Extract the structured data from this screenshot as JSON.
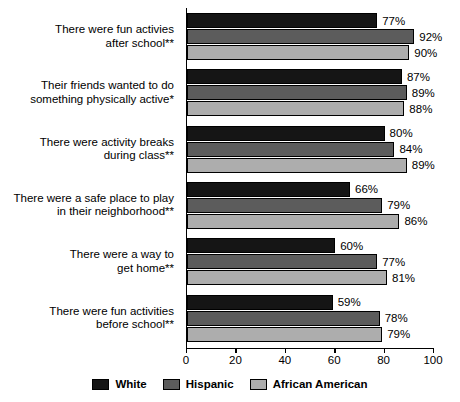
{
  "top_fragment": "",
  "chart_data": {
    "type": "bar",
    "orientation": "horizontal",
    "title": "",
    "xlabel": "",
    "ylabel": "",
    "xlim": [
      0,
      100
    ],
    "xticks": [
      0,
      20,
      40,
      60,
      80,
      100
    ],
    "xtick_labels": [
      "0",
      "20",
      "40",
      "60",
      "80",
      "100"
    ],
    "grid": false,
    "legend_position": "bottom-center",
    "value_label_suffix": "%",
    "categories": [
      "There were fun activies\nafter school**",
      "Their friends wanted to do\nsomething physically active*",
      "There were activity breaks\nduring class**",
      "There were a safe place to play\nin their neighborhood**",
      "There were a way to\nget home**",
      "There were fun activities\nbefore school**"
    ],
    "series": [
      {
        "name": "White",
        "color": "#151515",
        "values": [
          77,
          87,
          80,
          66,
          60,
          59
        ]
      },
      {
        "name": "Hispanic",
        "color": "#5c5c5c",
        "values": [
          92,
          89,
          84,
          79,
          77,
          78
        ]
      },
      {
        "name": "African American",
        "color": "#adadad",
        "values": [
          90,
          88,
          89,
          86,
          81,
          79
        ]
      }
    ],
    "value_labels": [
      [
        "77%",
        "92%",
        "90%"
      ],
      [
        "87%",
        "89%",
        "88%"
      ],
      [
        "80%",
        "84%",
        "89%"
      ],
      [
        "66%",
        "79%",
        "86%"
      ],
      [
        "60%",
        "77%",
        "81%"
      ],
      [
        "59%",
        "78%",
        "79%"
      ]
    ]
  },
  "categories_lines": [
    [
      "There were fun activies",
      "after school**"
    ],
    [
      "Their friends wanted to do",
      "something physically active*"
    ],
    [
      "There were activity breaks",
      "during class**"
    ],
    [
      "There were a safe place to play",
      "in their neighborhood**"
    ],
    [
      "There were a way to",
      "get home**"
    ],
    [
      "There were fun activities",
      "before school**"
    ]
  ],
  "legend": {
    "items": [
      {
        "label": "White"
      },
      {
        "label": "Hispanic"
      },
      {
        "label": "African American"
      }
    ]
  }
}
